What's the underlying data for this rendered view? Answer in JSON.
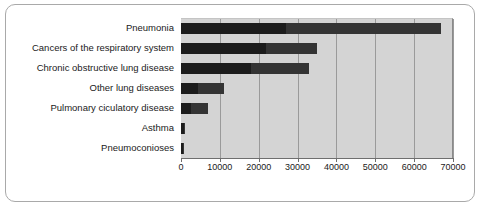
{
  "chart_data": {
    "type": "bar",
    "orientation": "horizontal",
    "stacked": true,
    "title": "",
    "xlabel": "",
    "ylabel": "",
    "xlim": [
      0,
      70000
    ],
    "xticks": [
      0,
      10000,
      20000,
      30000,
      40000,
      50000,
      60000,
      70000
    ],
    "xtick_labels": [
      "0",
      "10000",
      "20000",
      "30000",
      "40000",
      "50000",
      "60000",
      "70000"
    ],
    "grid": "vertical",
    "legend": "none",
    "categories": [
      "Pneumonia",
      "Cancers of the respiratory system",
      "Chronic obstructive lung disease",
      "Other lung diseases",
      "Pulmonary ciculatory disease",
      "Asthma",
      "Pneumoconioses"
    ],
    "series": [
      {
        "name": "Series 1",
        "color": "#1c1c1c",
        "values": [
          27000,
          22000,
          18000,
          4500,
          2500,
          700,
          600
        ]
      },
      {
        "name": "Series 2",
        "color": "#343434",
        "values": [
          40000,
          13000,
          15000,
          6500,
          4500,
          200,
          300
        ]
      }
    ],
    "totals": [
      67000,
      35000,
      33000,
      11000,
      7000,
      900,
      900
    ],
    "colors": {
      "plot_background": "#d4d4d4",
      "gridline": "#9a9a9a",
      "axis": "#6f6f6f",
      "frame": "#a9a9a9",
      "figure_background": "#ffffff",
      "label_text": "#1a1a1a"
    }
  }
}
